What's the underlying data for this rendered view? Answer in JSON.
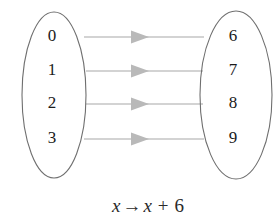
{
  "diagram": {
    "type": "mapping-diagram",
    "background_color": "#ffffff",
    "ellipse_stroke_color": "#6f6f6f",
    "arrow_color": "#c4c4c4",
    "arrowhead_color": "#b9b9b9",
    "text_color": "#1b1b1b",
    "domain_set": {
      "name": "domain",
      "elements": [
        "0",
        "1",
        "2",
        "3"
      ]
    },
    "codomain_set": {
      "name": "codomain",
      "elements": [
        "6",
        "7",
        "8",
        "9"
      ]
    },
    "mappings": [
      {
        "from": "0",
        "to": "6"
      },
      {
        "from": "1",
        "to": "7"
      },
      {
        "from": "2",
        "to": "8"
      },
      {
        "from": "3",
        "to": "9"
      }
    ],
    "caption": {
      "full": "x → x + 6",
      "variable_left": "x",
      "arrow_glyph": "→",
      "variable_right": "x",
      "operator": "+",
      "constant": "6"
    }
  }
}
